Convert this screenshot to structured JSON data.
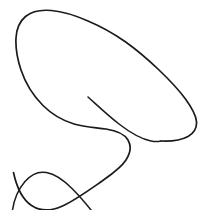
{
  "canvas": {
    "width": 209,
    "height": 210,
    "background_color": "#ffffff",
    "description": "Hand-drawn single-line contour sketch, black ink on white background"
  },
  "drawing": {
    "title": "freehand-contour-sketch",
    "stroke_color": "#1c1a1a",
    "stroke_width": 1.6,
    "stroke_width_thin": 1.4,
    "stroke_style": "solid",
    "line_cap": "round",
    "strokes": [
      {
        "id": "main-contour",
        "name": "main-outer-contour",
        "closed": false,
        "stroke_width": 1.7,
        "path": "M 13.5 172.5 C 16.5 186.5 22.5 199.5 31.5 205.5 C 40.5 211.5 51.5 211.0 62.5 206.0 C 76.5 199.5 90.5 189.0 103.5 180.0 C 113.5 173.0 121.5 167.0 126.0 160.0 C 130.5 153.0 131.5 146.0 128.0 140.0 C 124.0 133.0 115.5 130.5 106.0 129.0 C 96.0 127.5 84.5 127.0 74.0 124.0 C 62.5 120.5 52.0 114.5 43.0 105.5 C 33.5 96.0 25.5 83.5 21.0 70.0 C 17.0 58.0 15.5 46.5 16.0 38.0 C 16.5 29.0 19.5 21.5 25.5 16.5 C 31.5 11.5 40.5 9.5 51.5 10.5 C 63.0 11.5 75.5 15.5 88.0 21.0 C 101.0 26.5 113.5 33.5 125.0 41.5 C 137.0 50.0 148.0 59.5 158.5 69.5 C 169.0 79.5 178.5 89.5 185.5 99.0 C 192.0 108.0 196.0 115.5 196.5 121.5 C 197.0 128.0 194.0 133.0 188.0 136.5 C 181.5 140.0 172.0 141.5 161.0 141.0"
      },
      {
        "id": "inner-tail",
        "name": "inner-free-end-stroke",
        "closed": false,
        "stroke_width": 1.5,
        "path": "M 88.0 97.0 C 97.5 105.5 108.0 115.5 119.0 124.0 C 130.0 132.5 141.0 139.0 151.0 141.0 C 155.0 141.8 158.5 141.6 161.0 141.0"
      },
      {
        "id": "lower-left-arc",
        "name": "lower-left-secondary-arc",
        "closed": false,
        "stroke_width": 1.5,
        "path": "M 12.5 210.0 C 14.0 200.0 18.5 189.0 25.0 181.5 C 31.0 174.5 38.5 171.0 46.5 172.5 C 55.0 174.0 64.0 180.5 72.0 188.5 C 80.0 196.5 87.0 205.0 91.0 210.0"
      }
    ],
    "geometry_notes": {
      "leftmost_x": 13,
      "rightmost_x": 196,
      "topmost_y": 12,
      "bottommost_y": 210,
      "free_end_point": [
        88,
        97
      ],
      "top_flat_segment_x_range": [
        40,
        75
      ],
      "bottom_turn_point": [
        120,
        205
      ],
      "lower_arc_peak": [
        37,
        172
      ]
    }
  }
}
